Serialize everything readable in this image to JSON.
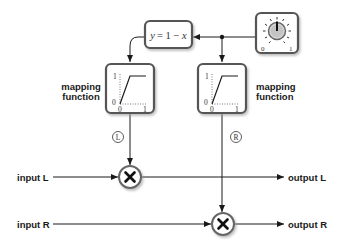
{
  "diagram": {
    "formula": {
      "lhs": "y",
      "eq": "= 1 − ",
      "rhs": "x"
    },
    "knob": {
      "min_label": "0",
      "max_label": "1",
      "icon": "rotary-knob-icon"
    },
    "mapping_left": {
      "label_line1": "mapping",
      "label_line2": "function",
      "y_top": "1",
      "y_bottom": "0",
      "x_left": "0",
      "x_right": "1",
      "channel": "L"
    },
    "mapping_right": {
      "label_line1": "mapping",
      "label_line2": "function",
      "y_top": "1",
      "y_bottom": "0",
      "x_left": "0",
      "x_right": "1",
      "channel": "R"
    },
    "inputs": {
      "left": "input L",
      "right": "input R"
    },
    "outputs": {
      "left": "output L",
      "right": "output R"
    },
    "multiplier_symbol": "×",
    "colors": {
      "line": "#1a1a1a",
      "box_border": "#555555",
      "shadow": "#bbbbbb"
    }
  }
}
